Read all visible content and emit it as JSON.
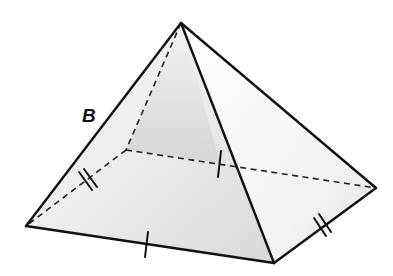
{
  "figure": {
    "type": "square pyramid",
    "labels": [
      {
        "id": "B",
        "text": "B",
        "x": 82,
        "y": 106
      }
    ],
    "vertices": {
      "apex": [
        181,
        23
      ],
      "base_left": [
        26,
        226
      ],
      "base_front": [
        274,
        263
      ],
      "base_right": [
        376,
        188
      ],
      "base_back": [
        126,
        150
      ]
    },
    "edges": {
      "visible": [
        [
          "apex",
          "base_left"
        ],
        [
          "apex",
          "base_front"
        ],
        [
          "apex",
          "base_right"
        ],
        [
          "base_left",
          "base_front"
        ],
        [
          "base_front",
          "base_right"
        ]
      ],
      "hidden": [
        [
          "apex",
          "base_back"
        ],
        [
          "base_back",
          "base_left"
        ],
        [
          "base_back",
          "base_right"
        ]
      ]
    },
    "tick_marks": [
      {
        "edge": "base_left-base_front",
        "count": 1
      },
      {
        "edge": "base_back-base_right",
        "count": 1
      },
      {
        "edge": "base_back-base_left",
        "count": 2
      },
      {
        "edge": "base_front-base_right",
        "count": 2
      }
    ],
    "colors": {
      "stroke": "#111111",
      "face_light": "#f4f4f4",
      "face_shade": "#d6d6d6",
      "background": "#ffffff"
    }
  }
}
